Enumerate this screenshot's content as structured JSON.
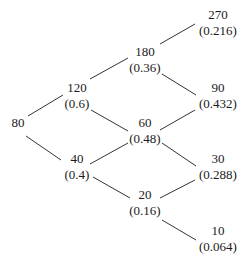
{
  "diagram": {
    "type": "binomial-tree",
    "nodes": [
      {
        "id": "n0",
        "value": "80",
        "prob": "",
        "x": 18,
        "y": 115
      },
      {
        "id": "n1u",
        "value": "120",
        "prob": "(0.6)",
        "x": 77,
        "y": 80
      },
      {
        "id": "n1d",
        "value": "40",
        "prob": "(0.4)",
        "x": 77,
        "y": 151
      },
      {
        "id": "n2uu",
        "value": "180",
        "prob": "(0.36)",
        "x": 145,
        "y": 44
      },
      {
        "id": "n2ud",
        "value": "60",
        "prob": "(0.48)",
        "x": 145,
        "y": 115
      },
      {
        "id": "n2dd",
        "value": "20",
        "prob": "(0.16)",
        "x": 145,
        "y": 187
      },
      {
        "id": "n3uuu",
        "value": "270",
        "prob": "(0.216)",
        "x": 218,
        "y": 7
      },
      {
        "id": "n3uud",
        "value": "90",
        "prob": "(0.432)",
        "x": 218,
        "y": 80
      },
      {
        "id": "n3udd",
        "value": "30",
        "prob": "(0.288)",
        "x": 218,
        "y": 151
      },
      {
        "id": "n3ddd",
        "value": "10",
        "prob": "(0.064)",
        "x": 218,
        "y": 223
      }
    ],
    "edges": [
      {
        "from": "n0",
        "to": "n1u",
        "x1": 28,
        "y1": 116,
        "x2": 63,
        "y2": 95
      },
      {
        "from": "n0",
        "to": "n1d",
        "x1": 26,
        "y1": 136,
        "x2": 61,
        "y2": 160
      },
      {
        "from": "n1u",
        "to": "n2uu",
        "x1": 90,
        "y1": 79,
        "x2": 128,
        "y2": 58
      },
      {
        "from": "n1u",
        "to": "n2ud",
        "x1": 91,
        "y1": 110,
        "x2": 128,
        "y2": 131
      },
      {
        "from": "n1d",
        "to": "n2ud",
        "x1": 90,
        "y1": 164,
        "x2": 128,
        "y2": 143
      },
      {
        "from": "n1d",
        "to": "n2dd",
        "x1": 93,
        "y1": 177,
        "x2": 130,
        "y2": 198
      },
      {
        "from": "n2uu",
        "to": "n3uuu",
        "x1": 160,
        "y1": 44,
        "x2": 195,
        "y2": 24
      },
      {
        "from": "n2uu",
        "to": "n3uud",
        "x1": 162,
        "y1": 74,
        "x2": 196,
        "y2": 95
      },
      {
        "from": "n2ud",
        "to": "n3uud",
        "x1": 160,
        "y1": 130,
        "x2": 195,
        "y2": 110
      },
      {
        "from": "n2ud",
        "to": "n3udd",
        "x1": 162,
        "y1": 143,
        "x2": 196,
        "y2": 166
      },
      {
        "from": "n2dd",
        "to": "n3udd",
        "x1": 160,
        "y1": 198,
        "x2": 195,
        "y2": 180
      },
      {
        "from": "n2dd",
        "to": "n3ddd",
        "x1": 162,
        "y1": 220,
        "x2": 196,
        "y2": 240
      }
    ],
    "line_color": "#333333",
    "text_color": "#1a1a1a"
  }
}
